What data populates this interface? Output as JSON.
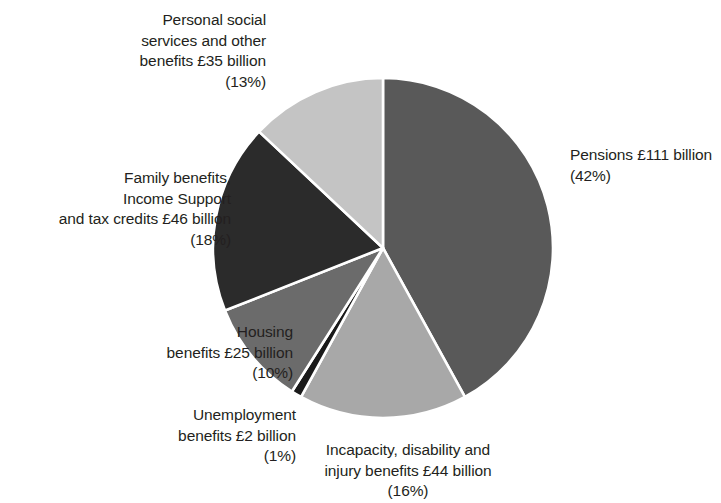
{
  "chart_data": {
    "type": "pie",
    "title": "",
    "subtitle": "",
    "xlabel": "",
    "ylabel": "",
    "legend_position": "none",
    "grid": false,
    "units": "£ billion",
    "start_angle_deg": 0,
    "direction": "clockwise",
    "categories": [
      "Pensions",
      "Incapacity, disability and injury benefits",
      "Unemployment benefits",
      "Housing benefits",
      "Family benefits, Income Support and tax credits",
      "Personal social services and other benefits"
    ],
    "values": [
      111,
      44,
      2,
      25,
      46,
      35
    ],
    "percentages": [
      42,
      16,
      1,
      10,
      18,
      13
    ],
    "colors": [
      "#595959",
      "#a8a8a8",
      "#1a1a1a",
      "#6b6b6b",
      "#2b2b2b",
      "#c4c4c4"
    ],
    "slices": [
      {
        "name": "pensions",
        "label": "Pensions £111 billion\n(42%)",
        "value": 111,
        "percent": 42,
        "color": "#595959"
      },
      {
        "name": "incapacity",
        "label": "Incapacity, disability and\ninjury benefits  £44 billion\n(16%)",
        "value": 44,
        "percent": 16,
        "color": "#a8a8a8"
      },
      {
        "name": "unemployment",
        "label": "Unemployment\nbenefits £2 billion\n(1%)",
        "value": 2,
        "percent": 1,
        "color": "#1a1a1a"
      },
      {
        "name": "housing",
        "label": "Housing\nbenefits £25 billion\n(10%)",
        "value": 25,
        "percent": 10,
        "color": "#6b6b6b"
      },
      {
        "name": "family-benefits",
        "label": "Family benefits,\nIncome Support\nand tax credits £46 billion\n(18%)",
        "value": 46,
        "percent": 18,
        "color": "#2b2b2b"
      },
      {
        "name": "personal-social-services",
        "label": "Personal social\nservices and other\nbenefits £35 billion\n(13%)",
        "value": 35,
        "percent": 13,
        "color": "#c4c4c4"
      }
    ],
    "separator_color": "#ffffff"
  },
  "labels": {
    "pensions": "Pensions £111 billion\n(42%)",
    "incapacity": "Incapacity, disability and\ninjury benefits  £44 billion\n(16%)",
    "unemployment": "Unemployment\nbenefits £2 billion\n(1%)",
    "housing": "Housing\nbenefits £25 billion\n(10%)",
    "family_benefits": "Family benefits,\nIncome Support\nand tax credits £46 billion\n(18%)",
    "personal_social": "Personal social\nservices and other\nbenefits £35 billion\n(13%)"
  },
  "source_note": ""
}
